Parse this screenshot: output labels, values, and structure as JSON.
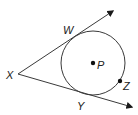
{
  "diagram": {
    "type": "geometry-tangent-circle",
    "colors": {
      "stroke": "#3a3a3a",
      "text": "#222222",
      "background": "#ffffff"
    },
    "circle": {
      "center_label": "P",
      "cx": 93,
      "cy": 63,
      "r": 32
    },
    "vertex": {
      "label": "X",
      "x": 18,
      "y": 74
    },
    "rays": [
      {
        "name": "ray-XW",
        "from": [
          18,
          74
        ],
        "to": [
          114,
          10
        ],
        "tangent_point": "W"
      },
      {
        "name": "ray-XY",
        "from": [
          18,
          74
        ],
        "to": [
          133,
          107
        ],
        "tangent_point": "Y"
      }
    ],
    "points": [
      {
        "label": "W",
        "x": 72,
        "y": 38,
        "on": "tangent"
      },
      {
        "label": "Y",
        "x": 88,
        "y": 94,
        "on": "tangent"
      },
      {
        "label": "P",
        "x": 93,
        "y": 63,
        "on": "center",
        "dot": true
      },
      {
        "label": "Z",
        "x": 120,
        "y": 81,
        "on": "circle",
        "dot": true
      }
    ],
    "labels": {
      "X": "X",
      "W": "W",
      "Y": "Y",
      "P": "P",
      "Z": "Z"
    }
  }
}
